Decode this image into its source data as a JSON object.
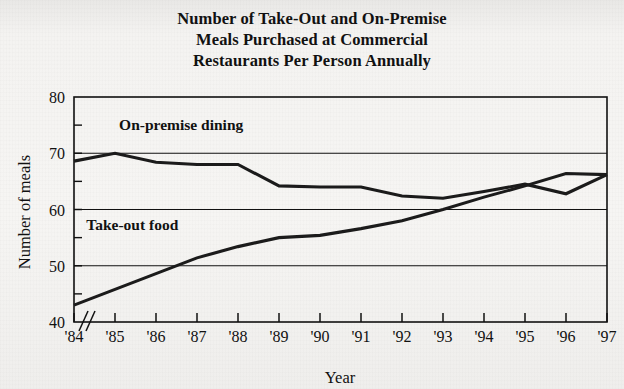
{
  "figure": {
    "title_lines": [
      "Number of Take-Out and On-Premise",
      "Meals Purchased at Commercial",
      "Restaurants Per Person Annually"
    ],
    "background_color": "#f4f3f1",
    "ink_color": "#111111"
  },
  "chart_data": {
    "type": "line",
    "title": "Number of Take-Out and On-Premise Meals Purchased at Commercial Restaurants Per Person Annually",
    "xlabel": "Year",
    "ylabel": "Number of meals",
    "categories": [
      "'84",
      "'85",
      "'86",
      "'87",
      "'88",
      "'89",
      "'90",
      "'91",
      "'92",
      "'93",
      "'94",
      "'95",
      "'96",
      "'97"
    ],
    "x_values": [
      1984,
      1985,
      1986,
      1987,
      1988,
      1989,
      1990,
      1991,
      1992,
      1993,
      1994,
      1995,
      1996,
      1997
    ],
    "xlim": [
      1984,
      1997
    ],
    "ylim": [
      40,
      80
    ],
    "y_major_ticks": [
      40,
      50,
      60,
      70,
      80
    ],
    "y_minor_ticks": [
      45,
      55,
      65,
      75
    ],
    "y_tick_labels": [
      "40",
      "50",
      "60",
      "70",
      "80"
    ],
    "grid": "horizontal-major",
    "axis_break": true,
    "axis_break_label": "//",
    "legend": "inline-labels",
    "series": [
      {
        "name": "On-premise dining",
        "label": "On-premise dining",
        "label_x": 1985.1,
        "label_y": 74.2,
        "values": [
          68.6,
          70.0,
          68.4,
          68.0,
          68.0,
          64.2,
          64.0,
          64.0,
          62.4,
          62.0,
          63.2,
          64.5,
          62.8,
          66.2
        ]
      },
      {
        "name": "Take-out food",
        "label": "Take-out food",
        "label_x": 1984.3,
        "label_y": 56.4,
        "values": [
          43.0,
          45.8,
          48.6,
          51.4,
          53.4,
          55.0,
          55.4,
          56.6,
          58.0,
          60.0,
          62.2,
          64.2,
          66.4,
          66.2
        ]
      }
    ]
  }
}
